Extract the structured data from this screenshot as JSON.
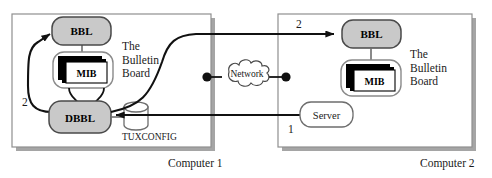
{
  "diagram": {
    "colors": {
      "node_fill": "#c9c9c9",
      "node_stroke": "#4a4a4a",
      "box_stroke": "#8a8a8a",
      "box_shadow": "#9a9a9a",
      "line": "#111111",
      "white": "#ffffff",
      "black": "#000000"
    },
    "computers": [
      {
        "id": "computer-1",
        "caption": "Computer 1",
        "bulletin_board_label": "The Bulletin Board",
        "bulletin_board_lines": [
          "The",
          "Bulletin",
          "Board"
        ],
        "nodes": {
          "bbl": "BBL",
          "mib": "MIB",
          "dbbl": "DBBL",
          "config_store": "TUXCONFIG"
        }
      },
      {
        "id": "computer-2",
        "caption": "Computer 2",
        "bulletin_board_label": "The Bulletin Board",
        "bulletin_board_lines": [
          "The",
          "Bulletin",
          "Board"
        ],
        "nodes": {
          "bbl": "BBL",
          "mib": "MIB",
          "server": "Server"
        }
      }
    ],
    "network": {
      "label": "Network"
    },
    "step_labels": {
      "left_step": "2",
      "right_step": "2",
      "server_step": "1"
    }
  }
}
